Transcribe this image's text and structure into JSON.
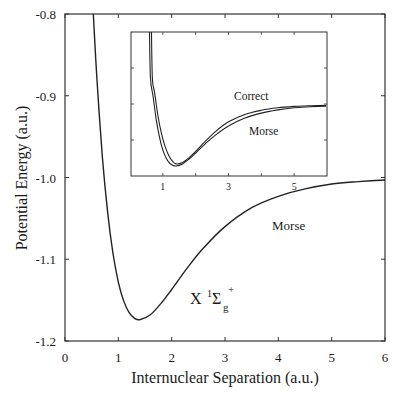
{
  "chart_data": {
    "type": "line",
    "title": "",
    "xlabel": "Internuclear Separation (a.u.)",
    "ylabel": "Potential Energy (a.u.)",
    "xlim": [
      0,
      6
    ],
    "ylim": [
      -1.2,
      -0.8
    ],
    "xticks": [
      "0",
      "1",
      "2",
      "3",
      "4",
      "5",
      "6"
    ],
    "yticks": [
      "-0.8",
      "-0.9",
      "-1.0",
      "-1.1",
      "-1.2"
    ],
    "grid": false,
    "legend": null,
    "annotations": [
      {
        "text": "Morse",
        "x": 4.6,
        "y": -1.065
      },
      {
        "text": "X ¹Σg⁺",
        "x": 2.2,
        "y": -1.175
      }
    ],
    "series": [
      {
        "name": "Morse",
        "x": [
          0.53,
          0.6,
          0.7,
          0.8,
          0.9,
          1.0,
          1.1,
          1.2,
          1.3,
          1.4,
          1.6,
          1.8,
          2.0,
          2.3,
          2.6,
          3.0,
          3.5,
          4.0,
          4.5,
          5.0,
          5.5,
          6.0
        ],
        "y": [
          -0.797,
          -0.881,
          -0.974,
          -1.043,
          -1.093,
          -1.128,
          -1.151,
          -1.165,
          -1.172,
          -1.174,
          -1.168,
          -1.154,
          -1.137,
          -1.11,
          -1.086,
          -1.06,
          -1.037,
          -1.023,
          -1.014,
          -1.008,
          -1.005,
          -1.003
        ]
      }
    ],
    "inset": {
      "type": "line",
      "xticks": [
        "1",
        "3",
        "5"
      ],
      "xlim": [
        0,
        6
      ],
      "yticks_count": 3,
      "labels": {
        "correct": "Correct",
        "morse": "Morse"
      },
      "series": [
        {
          "name": "Correct",
          "x": [
            0.68,
            0.75,
            0.85,
            0.95,
            1.05,
            1.15,
            1.25,
            1.4,
            1.6,
            1.8,
            2.0,
            2.3,
            2.6,
            3.0,
            3.5,
            4.0,
            4.5,
            5.0,
            5.5,
            5.97
          ],
          "y": [
            -0.92,
            -0.965,
            -1.03,
            -1.078,
            -1.113,
            -1.138,
            -1.155,
            -1.168,
            -1.164,
            -1.15,
            -1.132,
            -1.103,
            -1.076,
            -1.048,
            -1.027,
            -1.015,
            -1.008,
            -1.004,
            -1.002,
            -1.001
          ]
        },
        {
          "name": "Morse",
          "x": [
            0.62,
            0.7,
            0.8,
            0.9,
            1.0,
            1.1,
            1.2,
            1.3,
            1.4,
            1.6,
            1.8,
            2.0,
            2.3,
            2.6,
            3.0,
            3.5,
            4.0,
            4.5,
            5.0,
            5.5,
            5.97
          ],
          "y": [
            -0.92,
            -0.974,
            -1.043,
            -1.093,
            -1.128,
            -1.151,
            -1.165,
            -1.172,
            -1.174,
            -1.168,
            -1.154,
            -1.137,
            -1.11,
            -1.086,
            -1.06,
            -1.037,
            -1.023,
            -1.014,
            -1.008,
            -1.005,
            -1.003
          ]
        }
      ]
    }
  },
  "labels": {
    "xlabel": "Internuclear Separation (a.u.)",
    "ylabel": "Potential Energy (a.u.)",
    "morse_main": "Morse",
    "state_X": "X",
    "state_sup1": "1",
    "state_sigma": "Σ",
    "state_sub_g": "g",
    "state_sup_plus": "+",
    "inset_correct": "Correct",
    "inset_morse": "Morse"
  }
}
